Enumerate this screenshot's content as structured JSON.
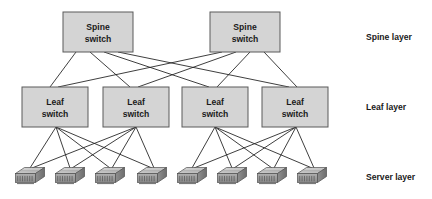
{
  "diagram": {
    "colors": {
      "box_fill": "#d4d4d4",
      "box_stroke": "#5a5a5a",
      "link_stroke": "#1c1c1c",
      "text": "#1a1a1a",
      "background": "#ffffff",
      "server_top": "#c9c9c9",
      "server_front": "#9a9a9a",
      "server_side": "#7d7d7d"
    },
    "layer_labels": [
      {
        "id": "spine-layer",
        "text": "Spine layer",
        "x": 366,
        "y": 40
      },
      {
        "id": "leaf-layer",
        "text": "Leaf layer",
        "x": 366,
        "y": 110
      },
      {
        "id": "server-layer",
        "text": "Server layer",
        "x": 366,
        "y": 180
      }
    ],
    "spine_switches": [
      {
        "id": "spine-1",
        "line1": "Spine",
        "line2": "switch",
        "x": 63,
        "y": 12,
        "w": 70,
        "h": 40
      },
      {
        "id": "spine-2",
        "line1": "Spine",
        "line2": "switch",
        "x": 210,
        "y": 12,
        "w": 70,
        "h": 40
      }
    ],
    "leaf_switches": [
      {
        "id": "leaf-1",
        "line1": "Leaf",
        "line2": "switch",
        "x": 22,
        "y": 87,
        "w": 66,
        "h": 40
      },
      {
        "id": "leaf-2",
        "line1": "Leaf",
        "line2": "switch",
        "x": 103,
        "y": 87,
        "w": 66,
        "h": 40
      },
      {
        "id": "leaf-3",
        "line1": "Leaf",
        "line2": "switch",
        "x": 182,
        "y": 87,
        "w": 66,
        "h": 40
      },
      {
        "id": "leaf-4",
        "line1": "Leaf",
        "line2": "switch",
        "x": 262,
        "y": 87,
        "w": 66,
        "h": 40
      }
    ],
    "servers": [
      {
        "id": "server-1",
        "cx": 30,
        "cy": 178,
        "pod": 1
      },
      {
        "id": "server-2",
        "cx": 70,
        "cy": 178,
        "pod": 1
      },
      {
        "id": "server-3",
        "cx": 110,
        "cy": 178,
        "pod": 1
      },
      {
        "id": "server-4",
        "cx": 152,
        "cy": 178,
        "pod": 1
      },
      {
        "id": "server-5",
        "cx": 192,
        "cy": 178,
        "pod": 2
      },
      {
        "id": "server-6",
        "cx": 232,
        "cy": 178,
        "pod": 2
      },
      {
        "id": "server-7",
        "cx": 272,
        "cy": 178,
        "pod": 2
      },
      {
        "id": "server-8",
        "cx": 312,
        "cy": 178,
        "pod": 2
      }
    ],
    "spine_leaf_links": [
      {
        "from": "spine-1",
        "to": "leaf-1",
        "x1": 76,
        "y1": 52,
        "x2": 50,
        "y2": 87
      },
      {
        "from": "spine-1",
        "to": "leaf-2",
        "x1": 90,
        "y1": 52,
        "x2": 130,
        "y2": 87
      },
      {
        "from": "spine-1",
        "to": "leaf-3",
        "x1": 104,
        "y1": 52,
        "x2": 209,
        "y2": 87
      },
      {
        "from": "spine-1",
        "to": "leaf-4",
        "x1": 118,
        "y1": 52,
        "x2": 289,
        "y2": 87
      },
      {
        "from": "spine-2",
        "to": "leaf-1",
        "x1": 222,
        "y1": 52,
        "x2": 58,
        "y2": 87
      },
      {
        "from": "spine-2",
        "to": "leaf-2",
        "x1": 236,
        "y1": 52,
        "x2": 138,
        "y2": 87
      },
      {
        "from": "spine-2",
        "to": "leaf-3",
        "x1": 250,
        "y1": 52,
        "x2": 217,
        "y2": 87
      },
      {
        "from": "spine-2",
        "to": "leaf-4",
        "x1": 264,
        "y1": 52,
        "x2": 297,
        "y2": 87
      }
    ],
    "leaf_server_links": [
      {
        "from": "leaf-1",
        "to": "server-1",
        "x1": 56,
        "y1": 127,
        "x2": 30,
        "y2": 168
      },
      {
        "from": "leaf-1",
        "to": "server-2",
        "x1": 56,
        "y1": 127,
        "x2": 70,
        "y2": 168
      },
      {
        "from": "leaf-1",
        "to": "server-3",
        "x1": 56,
        "y1": 127,
        "x2": 110,
        "y2": 168
      },
      {
        "from": "leaf-1",
        "to": "server-4",
        "x1": 56,
        "y1": 127,
        "x2": 152,
        "y2": 168
      },
      {
        "from": "leaf-2",
        "to": "server-1",
        "x1": 136,
        "y1": 127,
        "x2": 32,
        "y2": 168
      },
      {
        "from": "leaf-2",
        "to": "server-2",
        "x1": 136,
        "y1": 127,
        "x2": 72,
        "y2": 168
      },
      {
        "from": "leaf-2",
        "to": "server-3",
        "x1": 136,
        "y1": 127,
        "x2": 112,
        "y2": 168
      },
      {
        "from": "leaf-2",
        "to": "server-4",
        "x1": 136,
        "y1": 127,
        "x2": 154,
        "y2": 168
      },
      {
        "from": "leaf-3",
        "to": "server-5",
        "x1": 215,
        "y1": 127,
        "x2": 192,
        "y2": 168
      },
      {
        "from": "leaf-3",
        "to": "server-6",
        "x1": 215,
        "y1": 127,
        "x2": 232,
        "y2": 168
      },
      {
        "from": "leaf-3",
        "to": "server-7",
        "x1": 215,
        "y1": 127,
        "x2": 272,
        "y2": 168
      },
      {
        "from": "leaf-3",
        "to": "server-8",
        "x1": 215,
        "y1": 127,
        "x2": 312,
        "y2": 168
      },
      {
        "from": "leaf-4",
        "to": "server-5",
        "x1": 296,
        "y1": 127,
        "x2": 194,
        "y2": 168
      },
      {
        "from": "leaf-4",
        "to": "server-6",
        "x1": 296,
        "y1": 127,
        "x2": 234,
        "y2": 168
      },
      {
        "from": "leaf-4",
        "to": "server-7",
        "x1": 296,
        "y1": 127,
        "x2": 274,
        "y2": 168
      },
      {
        "from": "leaf-4",
        "to": "server-8",
        "x1": 296,
        "y1": 127,
        "x2": 314,
        "y2": 168
      }
    ]
  }
}
